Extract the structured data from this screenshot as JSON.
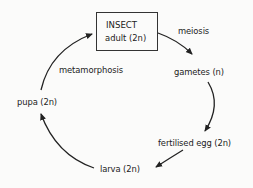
{
  "diagram": {
    "type": "cycle",
    "center_box": {
      "line1": "INSECT",
      "line2": "adult (2n)"
    },
    "stages": [
      {
        "id": "adult",
        "label": "INSECT adult (2n)"
      },
      {
        "id": "gametes",
        "label": "gametes (n)"
      },
      {
        "id": "fertilised_egg",
        "label": "fertilised egg (2n)"
      },
      {
        "id": "larva",
        "label": "larva (2n)"
      },
      {
        "id": "pupa",
        "label": "pupa (2n)"
      }
    ],
    "transitions": [
      {
        "from": "adult",
        "to": "gametes",
        "label": "meiosis"
      },
      {
        "from": "gametes",
        "to": "fertilised_egg",
        "label": ""
      },
      {
        "from": "fertilised_egg",
        "to": "larva",
        "label": ""
      },
      {
        "from": "larva",
        "to": "pupa",
        "label": ""
      },
      {
        "from": "pupa",
        "to": "adult",
        "label": "metamorphosis"
      }
    ],
    "colors": {
      "line": "#222222",
      "background": "#fbfbfa"
    }
  }
}
